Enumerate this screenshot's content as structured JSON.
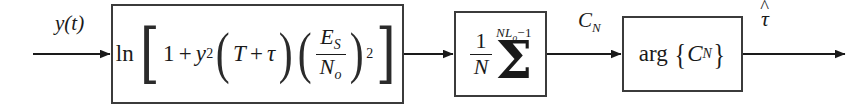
{
  "diagram": {
    "width": 852,
    "height": 109,
    "line_color": "#3b3b3b",
    "text_color": "#1a1a1a",
    "background": "#ffffff"
  },
  "signals": {
    "input_label": "y(t)",
    "intermediate_label_base": "C",
    "intermediate_label_sub": "N",
    "output_label_base": "τ",
    "output_hat": "^"
  },
  "blocks": {
    "log_likelihood": {
      "name": "ln-block",
      "ln_operator": "ln",
      "bracket_open": "[",
      "bracket_close": "]",
      "one": "1",
      "plus1": "+",
      "y": "y",
      "y_exponent": "2",
      "paren_open": "(",
      "T": "T",
      "plus2": "+",
      "tau": "τ",
      "paren_close": ")",
      "ratio_paren_open": "(",
      "ratio_paren_close": ")",
      "ratio_numerator": "E",
      "ratio_numerator_sub": "S",
      "ratio_denominator": "N",
      "ratio_denominator_sub": "o",
      "ratio_exponent": "2",
      "full_text": "ln [1 + y^2 (T + τ) (E_S / N_o)^2]"
    },
    "averager": {
      "name": "summation-block",
      "fraction_numerator": "1",
      "fraction_denominator": "N",
      "sigma": "Σ",
      "upper_limit_prefix": "NL",
      "upper_limit_sub": "o",
      "upper_limit_suffix": "−1",
      "full_text": "(1/N) Σ  upper limit NL_o − 1"
    },
    "arg": {
      "name": "arg-block",
      "operator": "arg",
      "brace_open": "{",
      "brace_close": "}",
      "argument_base": "C",
      "argument_sub": "N",
      "full_text": "arg {C_N}"
    }
  }
}
